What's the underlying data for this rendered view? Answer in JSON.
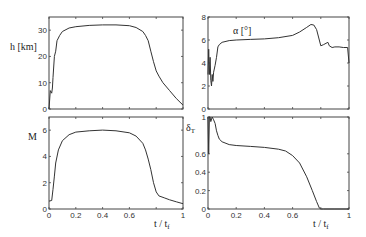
{
  "chart_data": [
    {
      "type": "line",
      "panel": "top-left",
      "title": "",
      "ylabel": "h [km]",
      "xlabel": "",
      "xlim": [
        0,
        1
      ],
      "ylim": [
        0,
        35
      ],
      "yticks": [
        0,
        10,
        20,
        30
      ],
      "xticks": [
        0,
        0.2,
        0.4,
        0.6,
        0.8,
        1
      ],
      "show_xticklabels": false,
      "grid": false,
      "box": {
        "x": 49,
        "y": 17,
        "w": 134,
        "h": 92
      },
      "series": [
        {
          "name": "h",
          "x": [
            0,
            0.01,
            0.02,
            0.025,
            0.03,
            0.04,
            0.05,
            0.06,
            0.07,
            0.08,
            0.1,
            0.15,
            0.2,
            0.3,
            0.4,
            0.5,
            0.6,
            0.65,
            0.7,
            0.72,
            0.74,
            0.76,
            0.78,
            0.8,
            0.82,
            0.85,
            0.9,
            0.95,
            1.0
          ],
          "values": [
            0,
            7,
            6,
            8,
            12,
            20,
            22,
            26,
            27,
            28,
            29.5,
            30.8,
            31.3,
            31.8,
            32.0,
            32.0,
            31.7,
            31.0,
            29.5,
            28.0,
            26.0,
            22.0,
            18.0,
            14.5,
            12.5,
            10.0,
            7.0,
            4.0,
            1.5
          ]
        }
      ]
    },
    {
      "type": "line",
      "panel": "top-right",
      "ylabel": "α [°]",
      "xlabel": "",
      "xlim": [
        0,
        1
      ],
      "ylim": [
        0,
        8
      ],
      "yticks": [
        0,
        2,
        4,
        6,
        8
      ],
      "xticks": [
        0,
        0.2,
        0.4,
        0.6,
        0.8,
        1
      ],
      "show_xticklabels": false,
      "grid": false,
      "box": {
        "x": 208,
        "y": 17,
        "w": 141,
        "h": 92
      },
      "series": [
        {
          "name": "alpha",
          "x": [
            0,
            0.005,
            0.01,
            0.015,
            0.02,
            0.025,
            0.03,
            0.035,
            0.04,
            0.05,
            0.06,
            0.07,
            0.08,
            0.1,
            0.15,
            0.2,
            0.3,
            0.4,
            0.5,
            0.6,
            0.65,
            0.7,
            0.73,
            0.75,
            0.77,
            0.8,
            0.82,
            0.85,
            0.86,
            0.88,
            0.9,
            0.93,
            0.96,
            0.99,
            1.0
          ],
          "values": [
            3.0,
            5.2,
            3.0,
            4.5,
            2.5,
            2.0,
            3.0,
            2.4,
            3.2,
            3.8,
            4.5,
            5.4,
            5.6,
            5.8,
            5.95,
            6.0,
            6.05,
            6.1,
            6.2,
            6.4,
            6.7,
            7.1,
            7.35,
            7.3,
            6.9,
            5.5,
            5.6,
            5.8,
            5.5,
            5.35,
            5.4,
            5.4,
            5.35,
            5.35,
            4.0
          ]
        }
      ]
    },
    {
      "type": "line",
      "panel": "bottom-left",
      "ylabel": "M",
      "xlabel": "t / t_f",
      "xlim": [
        0,
        1
      ],
      "ylim": [
        0,
        7
      ],
      "yticks": [
        0,
        2,
        4,
        6
      ],
      "xticks": [
        0,
        0.2,
        0.4,
        0.6,
        0.8,
        1
      ],
      "xticklabels": [
        "0",
        "0.2",
        "0.4",
        "0.6",
        "",
        "1"
      ],
      "grid": false,
      "box": {
        "x": 49,
        "y": 117,
        "w": 134,
        "h": 92
      },
      "series": [
        {
          "name": "M",
          "x": [
            0,
            0.02,
            0.03,
            0.04,
            0.05,
            0.07,
            0.1,
            0.15,
            0.2,
            0.3,
            0.4,
            0.5,
            0.6,
            0.65,
            0.7,
            0.72,
            0.74,
            0.76,
            0.78,
            0.8,
            0.82,
            0.86,
            0.9,
            0.95,
            1.0
          ],
          "values": [
            0.6,
            0.65,
            1.5,
            2.5,
            3.5,
            4.5,
            5.2,
            5.65,
            5.85,
            5.95,
            6.0,
            5.95,
            5.8,
            5.55,
            5.0,
            4.5,
            3.8,
            3.0,
            2.0,
            1.3,
            1.0,
            0.85,
            0.7,
            0.55,
            0.4
          ]
        }
      ]
    },
    {
      "type": "line",
      "panel": "bottom-right",
      "ylabel": "δ_T",
      "xlabel": "t / t_f",
      "xlim": [
        0,
        1
      ],
      "ylim": [
        0,
        1
      ],
      "yticks": [
        0,
        0.2,
        0.4,
        0.6,
        1
      ],
      "yticklabels": [
        "0",
        "0.2",
        "0.4",
        "0.6",
        "1"
      ],
      "xticks": [
        0,
        0.2,
        0.4,
        0.6,
        0.8,
        1
      ],
      "xticklabels": [
        "0",
        "0.2",
        "0.4",
        "0.6",
        "",
        "1"
      ],
      "grid": false,
      "box": {
        "x": 208,
        "y": 117,
        "w": 141,
        "h": 92
      },
      "series": [
        {
          "name": "delta_T",
          "x": [
            0,
            0.005,
            0.01,
            0.015,
            0.02,
            0.03,
            0.04,
            0.05,
            0.06,
            0.07,
            0.08,
            0.1,
            0.15,
            0.2,
            0.3,
            0.4,
            0.5,
            0.55,
            0.6,
            0.65,
            0.7,
            0.74,
            0.77,
            0.79,
            0.8,
            0.82,
            0.9,
            1.0
          ],
          "values": [
            1.0,
            0.6,
            1.0,
            1.0,
            0.95,
            1.0,
            0.97,
            0.93,
            0.85,
            0.8,
            0.76,
            0.73,
            0.7,
            0.69,
            0.68,
            0.67,
            0.65,
            0.63,
            0.58,
            0.5,
            0.35,
            0.2,
            0.08,
            0.01,
            0.0,
            0.0,
            0.0,
            0.0
          ]
        }
      ]
    }
  ],
  "labels": {
    "p0_ylabel": "h [km]",
    "p1_ylabel": "α [°]",
    "p2_ylabel": "M",
    "p3_ylabel_main": "δ",
    "p3_ylabel_sub": "T",
    "xlabel_main": "t / t",
    "xlabel_sub": "f"
  }
}
